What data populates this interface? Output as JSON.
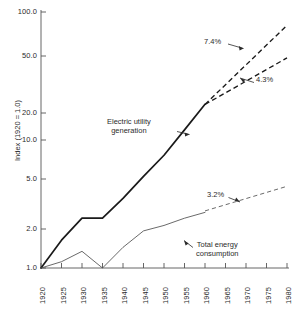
{
  "chart_data": {
    "type": "line",
    "title": "",
    "subtitle": "",
    "xlabel": "",
    "ylabel": "Index (1920 = 1.0)",
    "yscale": "log",
    "xscale": "linear",
    "xlim": [
      1920,
      1980
    ],
    "ylim": [
      1.0,
      100.0
    ],
    "grid": false,
    "legend_position": "none",
    "y_ticks": [
      "100.0",
      "50.0",
      "20.0",
      "10.0",
      "5.0",
      "2.0",
      "1.0"
    ],
    "y_tick_values": [
      100.0,
      50.0,
      20.0,
      10.0,
      5.0,
      2.0,
      1.0
    ],
    "x_ticks": [
      "1920",
      "1925",
      "1930",
      "1935",
      "1940",
      "1945",
      "1950",
      "1955",
      "1960",
      "1965",
      "1970",
      "1975",
      "1980"
    ],
    "x_tick_values": [
      1920,
      1925,
      1930,
      1935,
      1940,
      1945,
      1950,
      1955,
      1960,
      1965,
      1970,
      1975,
      1980
    ],
    "series": [
      {
        "name": "Electric utility generation",
        "style": "solid",
        "width": 1.6,
        "color": "#1a1a1a",
        "x": [
          1920,
          1925,
          1930,
          1935,
          1940,
          1945,
          1950,
          1955,
          1960
        ],
        "values": [
          1.0,
          1.65,
          2.45,
          2.45,
          3.5,
          5.2,
          7.6,
          12.0,
          19.0
        ]
      },
      {
        "name": "Electric utility generation projection high",
        "style": "dashed",
        "width": 1.3,
        "color": "#1a1a1a",
        "annotation": "7.4%",
        "x": [
          1960,
          1980
        ],
        "values": [
          19.0,
          79.0
        ]
      },
      {
        "name": "Electric utility generation projection low",
        "style": "dashed",
        "width": 1.3,
        "color": "#1a1a1a",
        "annotation": "4.3%",
        "x": [
          1960,
          1980
        ],
        "values": [
          19.0,
          44.0
        ]
      },
      {
        "name": "Total energy consumption",
        "style": "solid",
        "width": 0.8,
        "color": "#4a4a4a",
        "x": [
          1920,
          1925,
          1930,
          1935,
          1940,
          1945,
          1950,
          1955,
          1960
        ],
        "values": [
          1.0,
          1.12,
          1.35,
          1.0,
          1.45,
          1.95,
          2.15,
          2.45,
          2.72
        ]
      },
      {
        "name": "Total energy consumption projection",
        "style": "dashed",
        "width": 0.8,
        "color": "#4a4a4a",
        "annotation": "3.2%",
        "x": [
          1960,
          1980
        ],
        "values": [
          2.72,
          5.1
        ]
      }
    ],
    "annotations": [
      {
        "id": "growth-rate-74",
        "text": "7.4%",
        "points_to": "Electric utility generation projection high"
      },
      {
        "id": "growth-rate-43",
        "text": "4.3%",
        "points_to": "Electric utility generation projection low"
      },
      {
        "id": "growth-rate-32",
        "text": "3.2%",
        "points_to": "Total energy consumption projection"
      },
      {
        "id": "electric-label",
        "text_line1": "Electric utility",
        "text_line2": "generation",
        "points_to": "Electric utility generation"
      },
      {
        "id": "total-energy-label",
        "text_line1": "Total energy",
        "text_line2": "consumption",
        "points_to": "Total energy consumption"
      }
    ]
  },
  "axis": {
    "y_title": "Index (1920 = 1.0)",
    "y_labels": {
      "t100": "100.0",
      "t50": "50.0",
      "t20": "20.0",
      "t10": "10.0",
      "t5": "5.0",
      "t2": "2.0",
      "t1": "1.0"
    },
    "x_labels": {
      "y1920": "1920",
      "y1925": "1925",
      "y1930": "1930",
      "y1935": "1935",
      "y1940": "1940",
      "y1945": "1945",
      "y1950": "1950",
      "y1955": "1955",
      "y1960": "1960",
      "y1965": "1965",
      "y1970": "1970",
      "y1975": "1975",
      "y1980": "1980"
    }
  },
  "labels": {
    "electric_line1": "Electric utility",
    "electric_line2": "generation",
    "total_line1": "Total energy",
    "total_line2": "consumption",
    "rate_high": "7.4%",
    "rate_mid": "4.3%",
    "rate_low": "3.2%"
  },
  "colors": {
    "ink": "#1a1a1a",
    "secondary_ink": "#4a4a4a",
    "background": "#ffffff"
  }
}
